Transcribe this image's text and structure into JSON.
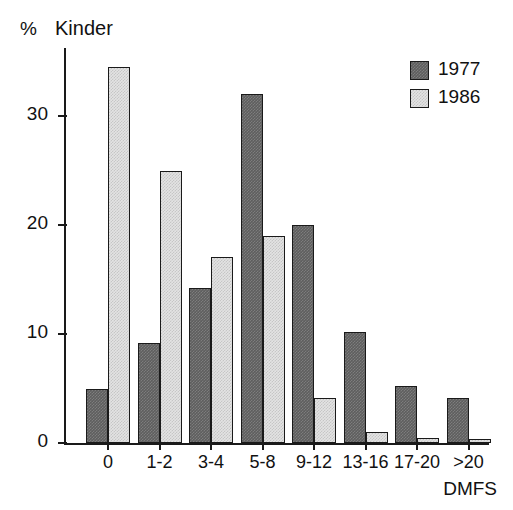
{
  "chart_data": {
    "type": "bar",
    "title": "Kinder",
    "unit_label": "%",
    "xlabel": "DMFS",
    "ylabel": "%",
    "categories": [
      "0",
      "1-2",
      "3-4",
      "5-8",
      "9-12",
      "13-16",
      "17-20",
      ">20"
    ],
    "series": [
      {
        "name": "1977",
        "color": "#5e5e5e",
        "values": [
          5.0,
          9.2,
          14.2,
          32.0,
          20.0,
          10.2,
          5.2,
          4.1
        ]
      },
      {
        "name": "1986",
        "color": "#e3e3e3",
        "values": [
          34.5,
          25.0,
          17.1,
          19.0,
          4.1,
          1.0,
          0.5,
          0.4
        ]
      }
    ],
    "ylim": [
      0,
      36.2
    ],
    "yticks": [
      "0",
      "10",
      "20",
      "30"
    ],
    "ytick_values": [
      0,
      10,
      20,
      30
    ],
    "grid": false,
    "legend": {
      "position": "top-right",
      "entries": [
        "1977",
        "1986"
      ]
    }
  }
}
